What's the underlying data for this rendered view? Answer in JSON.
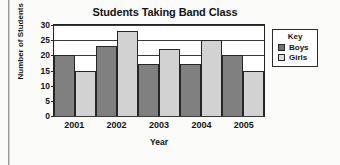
{
  "chart_data": {
    "type": "bar",
    "title": "Students Taking Band Class",
    "xlabel": "Year",
    "ylabel": "Number of Students",
    "categories": [
      "2001",
      "2002",
      "2003",
      "2004",
      "2005"
    ],
    "series": [
      {
        "name": "Boys",
        "values": [
          20,
          23,
          17,
          17,
          20
        ],
        "color": "#808080"
      },
      {
        "name": "Girls",
        "values": [
          15,
          28,
          22,
          25,
          15
        ],
        "color": "#d2d2d2"
      }
    ],
    "ylim": [
      0,
      30
    ],
    "yticks": [
      0,
      5,
      10,
      15,
      20,
      25,
      30
    ],
    "ytick_labels": [
      "0",
      "5",
      "10",
      "15",
      "20",
      "25",
      "30"
    ],
    "grid": true,
    "legend_position": "right",
    "legend_title": "Key"
  }
}
